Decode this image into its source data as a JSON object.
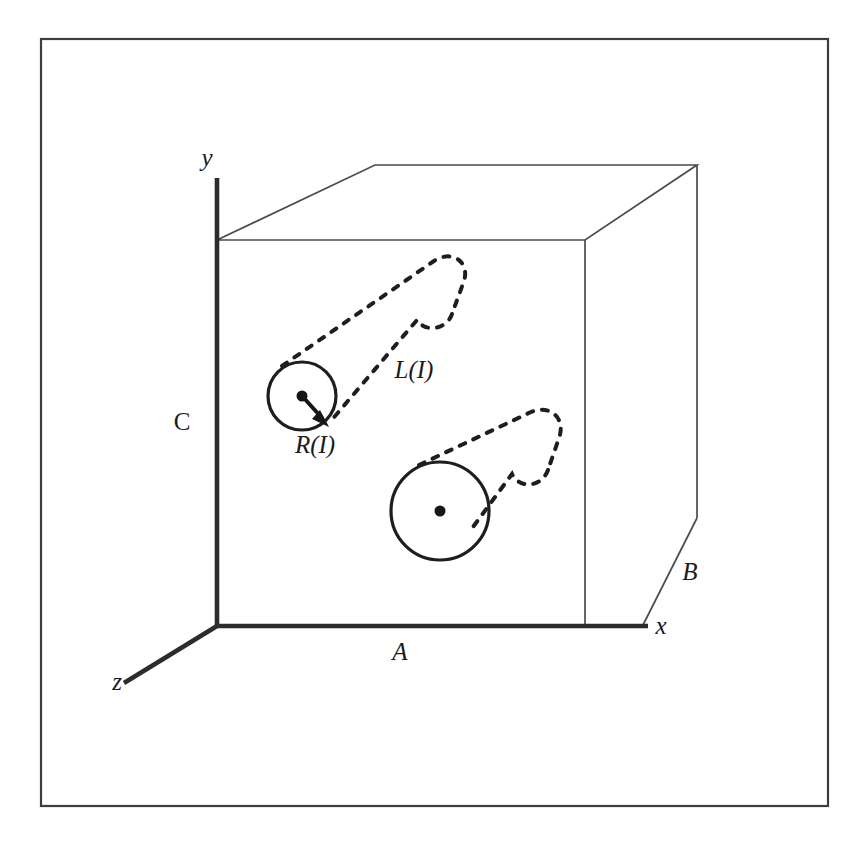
{
  "figure": {
    "background_color": "#ffffff",
    "frame_color": "#3c3c42",
    "line_color": "#1d1d22"
  },
  "axes": {
    "y_label": "y",
    "x_label": "x",
    "z_label": "z",
    "origin_label": ""
  },
  "cube": {
    "edge_labels": {
      "bottom_front": "A",
      "right_side": "B",
      "left_vertical": "C"
    }
  },
  "cylinders": [
    {
      "name": "cylinder-upper-left",
      "radius_label": "R(I)",
      "length_label": "L(I)",
      "center_marker": "dot",
      "outline_style": "solid-cap-dashed-body"
    },
    {
      "name": "cylinder-lower-right",
      "radius_label": "",
      "length_label": "",
      "center_marker": "dot",
      "outline_style": "solid-cap-dashed-body"
    }
  ],
  "labels": {
    "radius": "R(I)",
    "length": "L(I)",
    "dim_a": "A",
    "dim_b": "B",
    "dim_c": "C",
    "axis_x": "x",
    "axis_y": "y",
    "axis_z": "z"
  }
}
